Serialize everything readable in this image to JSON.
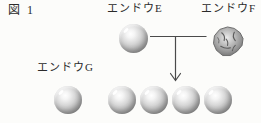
{
  "figure_label": "図 1",
  "diagram": {
    "parent_e": {
      "label": "エンドウE",
      "shape": "round-pea"
    },
    "parent_f": {
      "label": "エンドウF",
      "shape": "wrinkled-pea"
    },
    "reference_g": {
      "label": "エンドウG",
      "shape": "round-pea"
    },
    "cross": {
      "connector": "horizontal-line-with-down-arrow"
    },
    "offspring": {
      "count": 4,
      "shapes": [
        "round-pea",
        "round-pea",
        "round-pea",
        "round-pea"
      ]
    }
  },
  "colors": {
    "paper": "#fcfcfa",
    "ink": "#2b2b2b",
    "line": "#4a4a4a",
    "pea_highlight": "#ffffff",
    "pea_mid": "#d6d6d6",
    "pea_rim": "#7c7c7c",
    "wrinkled_pea_dark": "#5d5d5d"
  }
}
